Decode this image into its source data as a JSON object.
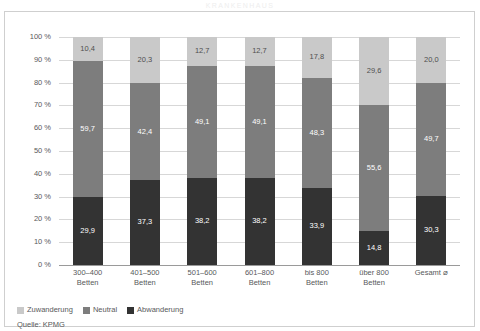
{
  "title_strip": "KRANKENHAUS",
  "legend": {
    "items": [
      {
        "label": "Zuwanderung",
        "color": "#c9c9c9",
        "key": "zuwanderung"
      },
      {
        "label": "Neutral",
        "color": "#7d7d7d",
        "key": "neutral"
      },
      {
        "label": "Abwanderung",
        "color": "#333333",
        "key": "abwanderung"
      }
    ]
  },
  "source": "Quelle: KPMG",
  "colors": {
    "zuwanderung": "#c9c9c9",
    "neutral": "#7d7d7d",
    "abwanderung": "#333333",
    "grid": "#d7d7d7",
    "axis": "#9a9a9a",
    "text": "#58595b",
    "frame": "#cfcfcf"
  },
  "chart_data": {
    "type": "bar",
    "stacked": true,
    "title": "",
    "xlabel": "",
    "ylabel": "",
    "ylim": [
      0,
      100
    ],
    "yticks": [
      "0 %",
      "10 %",
      "20 %",
      "30 %",
      "40 %",
      "50 %",
      "60 %",
      "70 %",
      "80 %",
      "90 %",
      "100 %"
    ],
    "ytick_values": [
      0,
      10,
      20,
      30,
      40,
      50,
      60,
      70,
      80,
      90,
      100
    ],
    "grid": true,
    "legend_position": "bottom-left",
    "categories": [
      "300–400\nBetten",
      "401–500\nBetten",
      "501–600\nBetten",
      "601–800\nBetten",
      "bis 800\nBetten",
      "über 800\nBetten",
      "Gesamt ⌀"
    ],
    "category_lines": [
      [
        "300–400",
        "Betten"
      ],
      [
        "401–500",
        "Betten"
      ],
      [
        "501–600",
        "Betten"
      ],
      [
        "601–800",
        "Betten"
      ],
      [
        "bis 800",
        "Betten"
      ],
      [
        "über 800",
        "Betten"
      ],
      [
        "Gesamt ⌀",
        ""
      ]
    ],
    "series": [
      {
        "name": "Abwanderung",
        "color": "#333333",
        "values": [
          29.9,
          37.3,
          38.2,
          38.2,
          33.9,
          14.8,
          30.3
        ],
        "labels": [
          "29,9",
          "37,3",
          "38,2",
          "38,2",
          "33,9",
          "14,8",
          "30,3"
        ]
      },
      {
        "name": "Neutral",
        "color": "#7d7d7d",
        "values": [
          59.7,
          42.4,
          49.1,
          49.1,
          48.3,
          55.6,
          49.7
        ],
        "labels": [
          "59,7",
          "42,4",
          "49,1",
          "49,1",
          "48,3",
          "55,6",
          "49,7"
        ]
      },
      {
        "name": "Zuwanderung",
        "color": "#c9c9c9",
        "values": [
          10.4,
          20.3,
          12.7,
          12.7,
          17.8,
          29.6,
          20.0
        ],
        "labels": [
          "10,4",
          "20,3",
          "12,7",
          "12,7",
          "17,8",
          "29,6",
          "20,0"
        ]
      }
    ]
  }
}
